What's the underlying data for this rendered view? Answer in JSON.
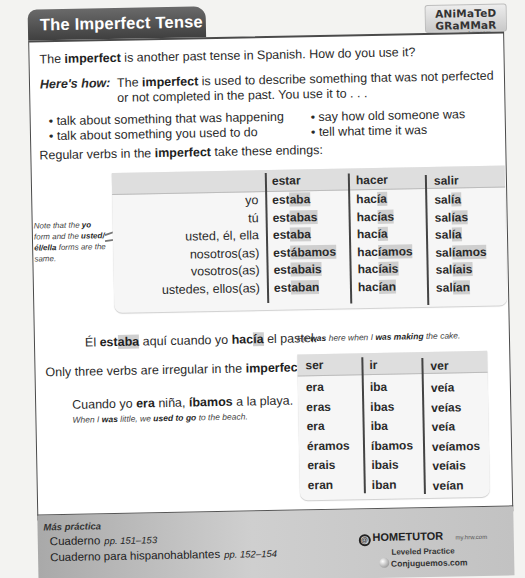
{
  "header": {
    "title": "The Imperfect Tense",
    "badge_title": "ANiMaTeD GRaMMaR",
    "badge_url": "my.hrw.com"
  },
  "intro": {
    "pre": "The ",
    "bold": "imperfect",
    "post": " is another past tense in Spanish. How do you use it?"
  },
  "heres_how": {
    "label": "Here's how:",
    "pre": "The ",
    "bold": "imperfect",
    "post": " is used to describe something that was not perfected or not completed in the past. You use it to . . ."
  },
  "uses_left": [
    "• talk about something that was happening",
    "• talk about something you used to do"
  ],
  "uses_right": [
    "• say how old someone was",
    "• tell what time it was"
  ],
  "regular_intro": {
    "pre": "Regular verbs in the ",
    "bold": "imperfect",
    "post": " take these endings:"
  },
  "side_note": {
    "p1": "Note that the ",
    "b1": "yo",
    "p2": " form and the ",
    "b2": "usted/él/ella",
    "p3": " forms are the same."
  },
  "regular_table": {
    "pronouns": [
      "yo",
      "tú",
      "usted, él, ella",
      "nosotros(as)",
      "vosotros(as)",
      "ustedes, ellos(as)"
    ],
    "verbs": [
      {
        "infinitive": "estar",
        "forms": [
          {
            "stem": "est",
            "ending": "aba"
          },
          {
            "stem": "est",
            "ending": "abas"
          },
          {
            "stem": "est",
            "ending": "aba"
          },
          {
            "stem": "est",
            "ending": "ábamos"
          },
          {
            "stem": "est",
            "ending": "abais"
          },
          {
            "stem": "est",
            "ending": "aban"
          }
        ]
      },
      {
        "infinitive": "hacer",
        "forms": [
          {
            "stem": "hac",
            "ending": "ía"
          },
          {
            "stem": "hac",
            "ending": "ías"
          },
          {
            "stem": "hac",
            "ending": "ía"
          },
          {
            "stem": "hac",
            "ending": "íamos"
          },
          {
            "stem": "hac",
            "ending": "íais"
          },
          {
            "stem": "hac",
            "ending": "ían"
          }
        ]
      },
      {
        "infinitive": "salir",
        "forms": [
          {
            "stem": "sal",
            "ending": "ía"
          },
          {
            "stem": "sal",
            "ending": "ías"
          },
          {
            "stem": "sal",
            "ending": "ía"
          },
          {
            "stem": "sal",
            "ending": "íamos"
          },
          {
            "stem": "sal",
            "ending": "íais"
          },
          {
            "stem": "sal",
            "ending": "ían"
          }
        ]
      }
    ]
  },
  "example1": {
    "w1": "Él ",
    "v1_stem": "est",
    "v1_end": "aba",
    "w2": " aquí cuando yo ",
    "v2_stem": "hac",
    "v2_end": "ía",
    "w3": " el pastel.",
    "en_1": "He ",
    "en_b1": "was",
    "en_2": " here when I ",
    "en_b2": "was making",
    "en_3": " the cake."
  },
  "irregular_intro": {
    "pre": "Only three verbs are irregular in the ",
    "bold": "imperfect."
  },
  "irregular_table": {
    "verbs": [
      {
        "infinitive": "ser",
        "forms": [
          "era",
          "eras",
          "era",
          "éramos",
          "erais",
          "eran"
        ]
      },
      {
        "infinitive": "ir",
        "forms": [
          "iba",
          "ibas",
          "iba",
          "íbamos",
          "ibais",
          "iban"
        ]
      },
      {
        "infinitive": "ver",
        "forms": [
          "veía",
          "veías",
          "veía",
          "veíamos",
          "veíais",
          "veían"
        ]
      }
    ]
  },
  "example2": {
    "w1": "Cuando yo ",
    "b1": "era",
    "w2": " niña, ",
    "b2": "íbamos",
    "w3": " a la playa.",
    "en_1": "When I ",
    "en_b1": "was",
    "en_2": " little, we ",
    "en_b2": "used to go",
    "en_3": " to the beach."
  },
  "footer": {
    "heading": "Más práctica",
    "line1": "Cuaderno",
    "line1_pages": "pp. 151–153",
    "line2": "Cuaderno para hispanohablantes",
    "line2_pages": "pp. 152–154",
    "hometutor": "HOMETUTOR",
    "hometutor_url": "my.hrw.com",
    "leveled": "Leveled Practice",
    "conjuguemos": "Conjuguemos.com"
  }
}
